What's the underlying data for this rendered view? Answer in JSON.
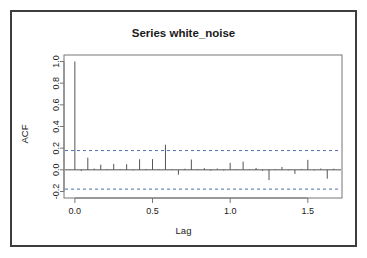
{
  "chart_data": {
    "type": "bar",
    "title": "Series  white_noise",
    "xlabel": "Lag",
    "ylabel": "ACF",
    "xlim": [
      -0.07,
      1.72
    ],
    "ylim": [
      -0.26,
      1.06
    ],
    "xticks": [
      0.0,
      0.5,
      1.0,
      1.5
    ],
    "xticklabels": [
      "0.0",
      "0.5",
      "1.0",
      "1.5"
    ],
    "yticks": [
      -0.2,
      0.0,
      0.2,
      0.4,
      0.6,
      0.8,
      1.0
    ],
    "yticklabels": [
      "-0.2",
      "0.0",
      "0.2",
      "0.4",
      "0.6",
      "0.8",
      "1.0"
    ],
    "grid": false,
    "legend": null,
    "confidence_bounds": [
      0.178,
      -0.178
    ],
    "confidence_line_style": "dashed",
    "confidence_color": "#4f6fb0",
    "spike_color": "#555555",
    "x": [
      0.0,
      0.0417,
      0.0833,
      0.125,
      0.1667,
      0.2083,
      0.25,
      0.2917,
      0.3333,
      0.375,
      0.4167,
      0.4583,
      0.5,
      0.5417,
      0.5833,
      0.625,
      0.6667,
      0.7083,
      0.75,
      0.7917,
      0.8333,
      0.875,
      0.9167,
      0.9583,
      1.0,
      1.0417,
      1.0833,
      1.125,
      1.1667,
      1.2083,
      1.25,
      1.2917,
      1.3333,
      1.375,
      1.4167,
      1.4583,
      1.5,
      1.5417,
      1.5833,
      1.625,
      1.6667
    ],
    "values": [
      1.0,
      -0.01,
      0.112,
      0.012,
      0.048,
      0.006,
      0.055,
      0.005,
      0.052,
      -0.004,
      0.098,
      0.008,
      0.099,
      0.004,
      0.232,
      0.006,
      -0.045,
      0.01,
      0.095,
      0.005,
      0.016,
      -0.008,
      0.012,
      -0.006,
      0.064,
      0.004,
      0.076,
      0.004,
      0.018,
      -0.01,
      -0.095,
      0.006,
      0.026,
      -0.004,
      -0.038,
      0.008,
      0.092,
      -0.006,
      0.012,
      -0.082,
      0.01
    ]
  }
}
